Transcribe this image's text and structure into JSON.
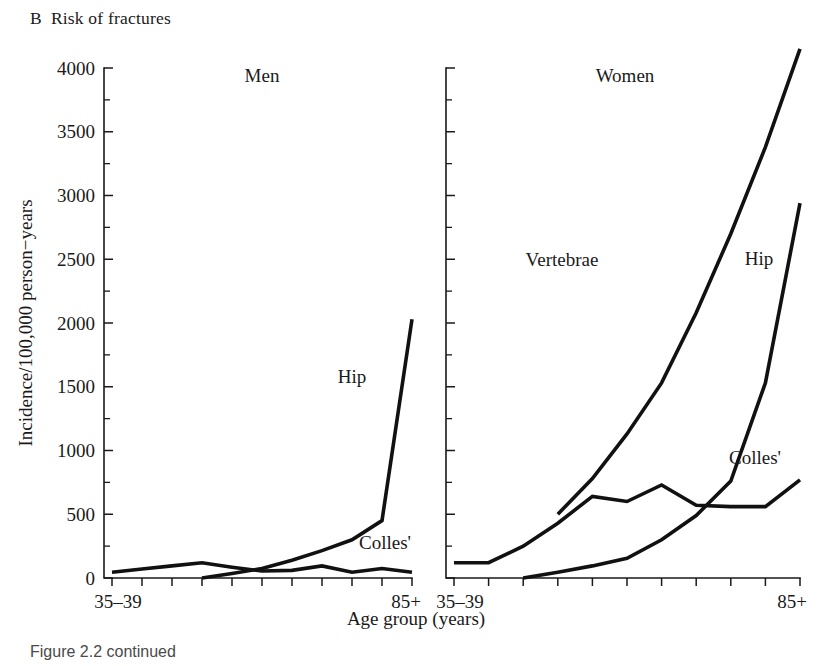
{
  "figure": {
    "panel_letter": "B",
    "panel_title": "Risk of fractures",
    "caption": "Figure 2.2 continued"
  },
  "chart_data": {
    "type": "line",
    "title": "Risk of fractures",
    "xlabel": "Age group (years)",
    "ylabel": "Incidence/100,000 person−years",
    "ylim": [
      0,
      4000
    ],
    "ytick_values": [
      0,
      500,
      1000,
      1500,
      2000,
      2500,
      3000,
      3500,
      4000
    ],
    "ytick_labels": [
      "0",
      "500",
      "1000",
      "1500",
      "2000",
      "2500",
      "3000",
      "3500",
      "4000"
    ],
    "minor_ticks": true,
    "grid": false,
    "legend": "inline-annotations",
    "categories": [
      "35–39",
      "40–44",
      "45–49",
      "50–54",
      "55–59",
      "60–64",
      "65–69",
      "70–74",
      "75–79",
      "80–84",
      "85+"
    ],
    "xtick_labels_shown": [
      "35–39",
      "85+"
    ],
    "panels": [
      {
        "name": "Men",
        "label": "Men",
        "series": [
          {
            "name": "Hip",
            "label": "Hip",
            "x": [
              "50–54",
              "55–59",
              "60–64",
              "65–69",
              "70–74",
              "75–79",
              "80–84",
              "85+"
            ],
            "values": [
              0,
              35,
              75,
              140,
              215,
              300,
              450,
              2030
            ]
          },
          {
            "name": "Colles'",
            "label": "Colles'",
            "x": [
              "35–39",
              "40–44",
              "45–49",
              "50–54",
              "55–59",
              "60–64",
              "65–69",
              "70–74",
              "75–79",
              "80–84",
              "85+"
            ],
            "values": [
              45,
              70,
              95,
              120,
              85,
              55,
              60,
              95,
              45,
              75,
              45
            ]
          }
        ]
      },
      {
        "name": "Women",
        "label": "Women",
        "series": [
          {
            "name": "Vertebrae",
            "label": "Vertebrae",
            "x": [
              "50–54",
              "55–59",
              "60–64",
              "65–69",
              "70–74",
              "75–79",
              "80–84",
              "85+"
            ],
            "values": [
              500,
              780,
              1130,
              1530,
              2080,
              2700,
              3380,
              4150
            ]
          },
          {
            "name": "Hip",
            "label": "Hip",
            "x": [
              "45–49",
              "50–54",
              "55–59",
              "60–64",
              "65–69",
              "70–74",
              "75–79",
              "80–84",
              "85+"
            ],
            "values": [
              0,
              45,
              95,
              155,
              300,
              490,
              760,
              1530,
              2940
            ]
          },
          {
            "name": "Colles'",
            "label": "Colles'",
            "x": [
              "35–39",
              "40–44",
              "45–49",
              "50–54",
              "55–59",
              "60–64",
              "65–69",
              "70–74",
              "75–79",
              "80–84",
              "85+"
            ],
            "values": [
              120,
              120,
              250,
              430,
              640,
              600,
              730,
              570,
              560,
              560,
              770
            ]
          }
        ]
      }
    ]
  }
}
